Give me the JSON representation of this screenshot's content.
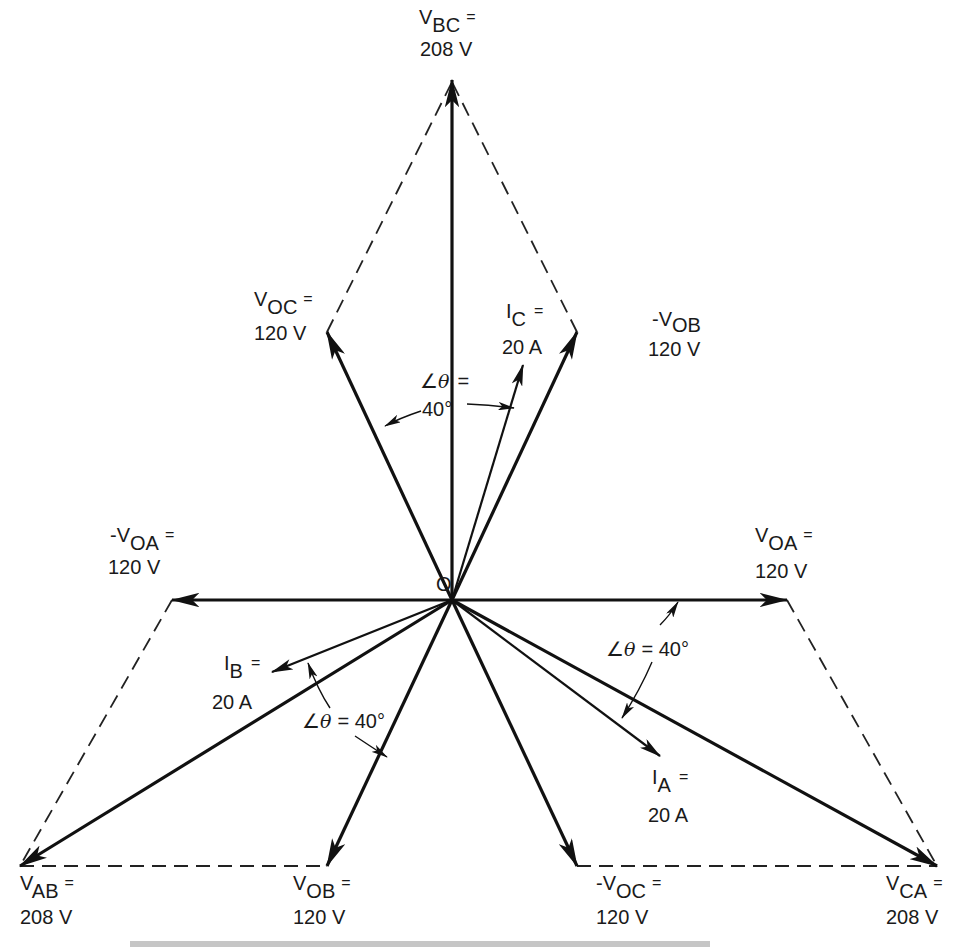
{
  "diagram": {
    "origin_label": "O",
    "colors": {
      "line": "#111111",
      "background": "#ffffff"
    },
    "phasors": [
      {
        "id": "V_BC",
        "prefix": "",
        "main": "V",
        "sub": "BC",
        "eq": "=",
        "value": "208 V",
        "kind": "line-voltage",
        "direction_deg": 90
      },
      {
        "id": "V_OC",
        "prefix": "",
        "main": "V",
        "sub": "OC",
        "eq": "=",
        "value": "120 V",
        "kind": "phase-voltage",
        "direction_deg": 120
      },
      {
        "id": "-V_OB",
        "prefix": "-",
        "main": "V",
        "sub": "OB",
        "eq": "",
        "value": "120 V",
        "kind": "phase-voltage",
        "direction_deg": 60
      },
      {
        "id": "I_C",
        "prefix": "",
        "main": "I",
        "sub": "C",
        "eq": "=",
        "value": "20 A",
        "kind": "current",
        "direction_deg": 80
      },
      {
        "id": "-V_OA",
        "prefix": "-",
        "main": "V",
        "sub": "OA",
        "eq": "=",
        "value": "120 V",
        "kind": "phase-voltage",
        "direction_deg": 180
      },
      {
        "id": "V_OA",
        "prefix": "",
        "main": "V",
        "sub": "OA",
        "eq": "=",
        "value": "120 V",
        "kind": "phase-voltage",
        "direction_deg": 0
      },
      {
        "id": "I_B",
        "prefix": "",
        "main": "I",
        "sub": "B",
        "eq": "=",
        "value": "20 A",
        "kind": "current",
        "direction_deg": 200
      },
      {
        "id": "I_A",
        "prefix": "",
        "main": "I",
        "sub": "A",
        "eq": "=",
        "value": "20 A",
        "kind": "current",
        "direction_deg": 320
      },
      {
        "id": "V_AB",
        "prefix": "",
        "main": "V",
        "sub": "AB",
        "eq": "=",
        "value": "208 V",
        "kind": "line-voltage",
        "direction_deg": 210
      },
      {
        "id": "V_OB",
        "prefix": "",
        "main": "V",
        "sub": "OB",
        "eq": "=",
        "value": "120 V",
        "kind": "phase-voltage",
        "direction_deg": 240
      },
      {
        "id": "-V_OC",
        "prefix": "-",
        "main": "V",
        "sub": "OC",
        "eq": "=",
        "value": "120 V",
        "kind": "phase-voltage",
        "direction_deg": 300
      },
      {
        "id": "V_CA",
        "prefix": "",
        "main": "V",
        "sub": "CA",
        "eq": "=",
        "value": "208 V",
        "kind": "line-voltage",
        "direction_deg": 330
      }
    ],
    "angles": [
      {
        "id": "theta_top",
        "symbol": "∠",
        "var": "θ",
        "line1": "=",
        "line2": "40°"
      },
      {
        "id": "theta_left",
        "symbol": "∠",
        "var": "θ",
        "text": "= 40°"
      },
      {
        "id": "theta_right",
        "symbol": "∠",
        "var": "θ",
        "text": "= 40°"
      }
    ]
  }
}
